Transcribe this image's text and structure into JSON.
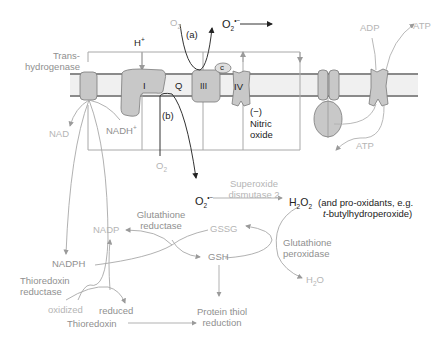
{
  "membrane": {
    "transhydrogenase_label_line1": "Trans-",
    "transhydrogenase_label_line2": "hydrogenase",
    "proton": "H",
    "proton_sup": "+",
    "complex_I": "I",
    "quinone": "Q",
    "complex_III": "III",
    "cytochrome_c": "c",
    "complex_IV": "IV",
    "inhibitor_sign": "(−)",
    "nitric_oxide_line1": "Nitric",
    "nitric_oxide_line2": "oxide",
    "path_a": "(a)",
    "path_b": "(b)",
    "o2_top": "O",
    "o2_top_sub": "2",
    "o2_lower": "O",
    "o2_lower_sub": "2",
    "superoxide_top": "O",
    "superoxide_top_sub": "2",
    "superoxide_top_sup": "•−",
    "nad": "NAD",
    "nadh": "NADH",
    "nadh_sup": "+",
    "adp": "ADP",
    "atp_top": "ATP",
    "atp_bottom": "ATP"
  },
  "pathway": {
    "superoxide": "O",
    "superoxide_sub": "2",
    "superoxide_sup": "•−",
    "sod_line1": "Superoxide",
    "sod_line2": "dismutase 2",
    "h2o2_h": "H",
    "h2o2_sub1": "2",
    "h2o2_o": "O",
    "h2o2_sub2": "2",
    "pro_oxidants_line1": "(and pro-oxidants, e.g.",
    "pro_oxidants_line2_italic": "t",
    "pro_oxidants_line2_rest": "-butylhydroperoxide)",
    "glutathione_reductase_line1": "Glutathione",
    "glutathione_reductase_line2": "reductase",
    "nadp": "NADP",
    "gssg": "GSSG",
    "gsh": "GSH",
    "glutathione_peroxidase_line1": "Glutathione",
    "glutathione_peroxidase_line2": "peroxidase",
    "h2o_h": "H",
    "h2o_sub": "2",
    "h2o_o": "O",
    "nadph": "NADPH",
    "thioredoxin_reductase_line1": "Thioredoxin",
    "thioredoxin_reductase_line2": "reductase",
    "oxidized": "oxidized",
    "reduced": "reduced",
    "thioredoxin": "Thioredoxin",
    "protein_thiol_line1": "Protein thiol",
    "protein_thiol_line2": "reduction"
  },
  "colors": {
    "protein_fill": "#c8c8c8",
    "protein_stroke": "#7a7a7a",
    "membrane_line": "#8a8a8a",
    "membrane_fill": "#efefef",
    "frame_line": "#a8a8a8",
    "dark_text": "#222222",
    "grey_text": "#8f8f8f",
    "light_text": "#b5b5b5"
  }
}
